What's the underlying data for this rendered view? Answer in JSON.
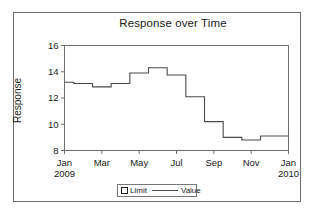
{
  "figure": {
    "title": "Response over Time",
    "y_axis_title": "Response"
  },
  "legend": {
    "limit_label": "Limit",
    "value_label": "Value"
  },
  "chart_data": {
    "type": "line",
    "subtype": "step",
    "title": "Response over Time",
    "xlabel": "",
    "ylabel": "Response",
    "ylim": [
      8,
      16
    ],
    "y_ticks": [
      8,
      10,
      12,
      14,
      16
    ],
    "y_tick_labels": [
      "8",
      "10",
      "12",
      "14",
      "16"
    ],
    "x_tick_labels": [
      "Jan",
      "Mar",
      "May",
      "Jul",
      "Sep",
      "Nov",
      "Jan"
    ],
    "x_tick_sublabels": [
      "2009",
      "",
      "",
      "",
      "",
      "",
      "2010"
    ],
    "x_tick_indices": [
      0,
      2,
      4,
      6,
      8,
      10,
      12
    ],
    "grid": false,
    "legend_position": "bottom-center",
    "line_color": "#4a4a4a",
    "frame_color": "#6e6e6e",
    "categories": [
      "Jan 2009",
      "Feb 2009",
      "Mar 2009",
      "Apr 2009",
      "May 2009",
      "Jun 2009",
      "Jul 2009",
      "Aug 2009",
      "Sep 2009",
      "Oct 2009",
      "Nov 2009",
      "Dec 2009",
      "Jan 2010"
    ],
    "series": [
      {
        "name": "Value",
        "values": [
          13.2,
          13.1,
          12.85,
          13.1,
          13.9,
          14.3,
          13.75,
          12.1,
          10.2,
          9.0,
          8.8,
          9.1,
          9.1
        ]
      }
    ]
  }
}
